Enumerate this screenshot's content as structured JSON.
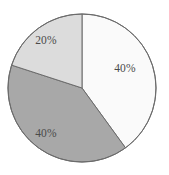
{
  "chart_data": {
    "type": "pie",
    "title": "",
    "subtitle": "",
    "xlabel": "",
    "ylabel": "",
    "legend": "none",
    "grid": false,
    "categories": [
      "Slice A",
      "Slice B",
      "Slice C"
    ],
    "values": [
      40,
      40,
      20
    ],
    "labels": [
      "40%",
      "40%",
      "20%"
    ],
    "units": "percent",
    "total": 100,
    "start_angle_deg": 0,
    "direction": "clockwise",
    "slices": [
      {
        "name": "Slice A",
        "value": 40,
        "label": "40%",
        "color": "#fafafa",
        "start_angle_deg": 0,
        "end_angle_deg": 144,
        "label_x": 125,
        "label_y": 68
      },
      {
        "name": "Slice B",
        "value": 40,
        "label": "40%",
        "color": "#a8a8a8",
        "start_angle_deg": 144,
        "end_angle_deg": 288,
        "label_x": 46,
        "label_y": 133
      },
      {
        "name": "Slice C",
        "value": 20,
        "label": "20%",
        "color": "#dcdcdc",
        "start_angle_deg": 288,
        "end_angle_deg": 360,
        "label_x": 46,
        "label_y": 40
      }
    ],
    "geometry": {
      "center_x": 82,
      "center_y": 88,
      "radius": 74
    },
    "style": {
      "background": "#ffffff",
      "outline_color": "#6b6b6b",
      "outline_width": 1,
      "label_color": "#4a4a4a"
    }
  }
}
